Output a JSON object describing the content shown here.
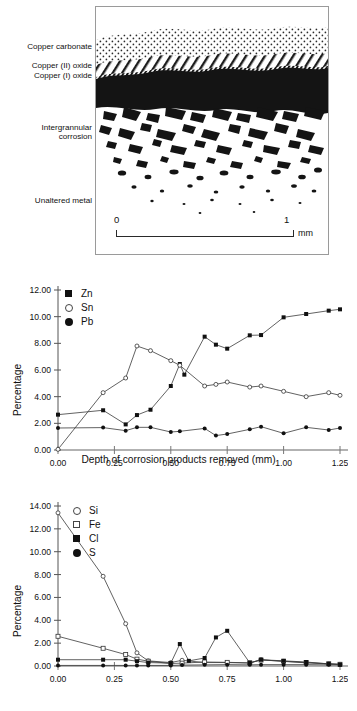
{
  "figure_top": {
    "name": "corrosion-cross-section",
    "labels": {
      "copper_carbonate": "Copper carbonate",
      "copper_ii_oxide": "Copper (II) oxide",
      "copper_i_oxide": "Copper (I) oxide",
      "intergrannular_corrosion": "Intergrannular\ncorrosion",
      "unaltered_metal": "Unaltered metal"
    },
    "scale": {
      "start": "0",
      "end": "1",
      "unit": "mm"
    }
  },
  "chart_data": [
    {
      "id": "metals",
      "type": "line",
      "title": "",
      "xlabel": "Depth of corrosion products removed (mm)",
      "ylabel": "Percentage",
      "xlim": [
        0.0,
        1.25
      ],
      "ylim": [
        0.0,
        12.0
      ],
      "xticks": [
        "0.00",
        "0.25",
        "0.50",
        "0.75",
        "1.00",
        "1.25"
      ],
      "yticks": [
        "0.00",
        "2.00",
        "4.00",
        "6.00",
        "8.00",
        "10.00",
        "12.00"
      ],
      "grid": false,
      "legend_position": "top-left",
      "series": [
        {
          "name": "Zn",
          "marker": "filled-square",
          "x": [
            0.0,
            0.2,
            0.3,
            0.35,
            0.41,
            0.5,
            0.54,
            0.56,
            0.65,
            0.7,
            0.75,
            0.85,
            0.9,
            1.0,
            1.1,
            1.2,
            1.25
          ],
          "values": [
            2.65,
            2.98,
            1.92,
            2.62,
            3.02,
            4.8,
            6.45,
            5.65,
            8.5,
            7.9,
            7.6,
            8.6,
            8.62,
            9.95,
            10.2,
            10.45,
            10.55
          ]
        },
        {
          "name": "Sn",
          "marker": "open-circle",
          "x": [
            0.0,
            0.2,
            0.3,
            0.35,
            0.41,
            0.5,
            0.54,
            0.65,
            0.7,
            0.75,
            0.85,
            0.9,
            1.0,
            1.1,
            1.2,
            1.25
          ],
          "values": [
            0.05,
            4.3,
            5.4,
            7.8,
            7.45,
            6.7,
            6.35,
            4.8,
            4.92,
            5.1,
            4.72,
            4.8,
            4.4,
            4.0,
            4.3,
            4.1
          ]
        },
        {
          "name": "Pb",
          "marker": "filled-circle",
          "x": [
            0.0,
            0.2,
            0.3,
            0.35,
            0.41,
            0.5,
            0.54,
            0.65,
            0.7,
            0.75,
            0.85,
            0.9,
            1.0,
            1.1,
            1.2,
            1.25
          ],
          "values": [
            1.65,
            1.68,
            1.45,
            1.7,
            1.7,
            1.35,
            1.4,
            1.62,
            1.08,
            1.2,
            1.55,
            1.75,
            1.25,
            1.7,
            1.5,
            1.65
          ]
        }
      ]
    },
    {
      "id": "nonmetals",
      "type": "line",
      "title": "",
      "xlabel": "",
      "ylabel": "Percentage",
      "xlim": [
        0.0,
        1.25
      ],
      "ylim": [
        0.0,
        14.0
      ],
      "xticks": [
        "0.00",
        "0.25",
        "0.50",
        "0.75",
        "1.00",
        "1.25"
      ],
      "yticks": [
        "0.00",
        "2.00",
        "4.00",
        "6.00",
        "8.00",
        "10.00",
        "12.00",
        "14.00"
      ],
      "grid": false,
      "legend_position": "top-left",
      "series": [
        {
          "name": "Si",
          "marker": "open-circle",
          "x": [
            0.0,
            0.2,
            0.3,
            0.35,
            0.4,
            0.5,
            0.55,
            0.65,
            0.75,
            0.85,
            0.9,
            1.0,
            1.1,
            1.2,
            1.25
          ],
          "values": [
            13.4,
            7.85,
            3.7,
            1.15,
            0.45,
            0.3,
            0.5,
            0.3,
            0.3,
            0.25,
            0.55,
            0.4,
            0.28,
            0.18,
            0.15
          ]
        },
        {
          "name": "Fe",
          "marker": "open-square",
          "x": [
            0.0,
            0.2,
            0.3,
            0.35,
            0.4,
            0.5,
            0.55,
            0.65,
            0.75,
            0.85,
            0.9,
            1.0,
            1.1,
            1.2,
            1.25
          ],
          "values": [
            2.6,
            1.55,
            1.0,
            0.6,
            0.42,
            0.22,
            0.25,
            0.35,
            0.32,
            0.28,
            0.52,
            0.42,
            0.3,
            0.2,
            0.15
          ]
        },
        {
          "name": "Cl",
          "marker": "filled-square",
          "x": [
            0.0,
            0.2,
            0.3,
            0.35,
            0.4,
            0.5,
            0.54,
            0.58,
            0.65,
            0.7,
            0.75,
            0.85,
            0.9,
            1.0,
            1.1,
            1.2,
            1.25
          ],
          "values": [
            0.55,
            0.55,
            0.55,
            0.42,
            0.3,
            0.25,
            1.92,
            0.45,
            0.7,
            2.5,
            3.08,
            0.28,
            0.55,
            0.45,
            0.35,
            0.18,
            0.12
          ]
        },
        {
          "name": "S",
          "marker": "filled-circle",
          "x": [
            0.0,
            0.2,
            0.3,
            0.35,
            0.4,
            0.5,
            0.55,
            0.65,
            0.75,
            0.85,
            0.9,
            1.0,
            1.1,
            1.2,
            1.25
          ],
          "values": [
            0.05,
            0.05,
            0.05,
            0.05,
            0.05,
            0.05,
            0.08,
            0.1,
            0.12,
            0.1,
            0.12,
            0.12,
            0.12,
            0.1,
            0.1
          ]
        }
      ]
    }
  ]
}
